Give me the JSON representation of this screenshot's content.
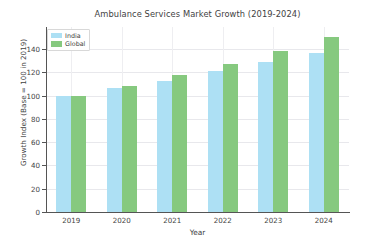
{
  "chart_data": {
    "type": "bar",
    "title": "Ambulance Services Market Growth (2019-2024)",
    "xlabel": "Year",
    "ylabel": "Growth Index (Base = 100 in 2019)",
    "categories": [
      "2019",
      "2020",
      "2021",
      "2022",
      "2023",
      "2024"
    ],
    "series": [
      {
        "name": "India",
        "color": "#ade0f4",
        "values": [
          100,
          107,
          113,
          121.5,
          129,
          136.5
        ]
      },
      {
        "name": "Global",
        "color": "#86c97f",
        "values": [
          99.5,
          108,
          117.5,
          127.5,
          138.5,
          150.5
        ]
      }
    ],
    "ylim": [
      0,
      159
    ],
    "yticks": [
      0,
      20,
      40,
      60,
      80,
      100,
      120,
      140
    ],
    "ytick_labels": [
      "0",
      "20",
      "40",
      "60",
      "80",
      "100",
      "120",
      "140"
    ],
    "grid": true,
    "legend_position": "upper left"
  },
  "legend": {
    "items": [
      {
        "label": "India"
      },
      {
        "label": "Global"
      }
    ]
  }
}
